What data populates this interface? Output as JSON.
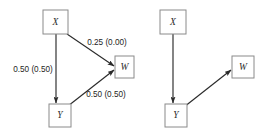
{
  "figure": {
    "type": "path-diagram",
    "background_color": "#ffffff",
    "node_stroke_color": "#8a8a8a",
    "edge_color": "#2a2a2a",
    "panels": [
      {
        "id": "left-panel",
        "nodes": [
          {
            "id": "x",
            "label": "X",
            "x": 43,
            "y": 10,
            "w": 25,
            "h": 24
          },
          {
            "id": "w",
            "label": "W",
            "x": 115,
            "y": 56,
            "w": 19,
            "h": 22
          },
          {
            "id": "y",
            "label": "Y",
            "x": 49,
            "y": 104,
            "w": 22,
            "h": 23
          }
        ],
        "edges": [
          {
            "id": "x-to-w",
            "from": "x",
            "to": "w",
            "label": "0.25 (0.00)",
            "label_x": 107,
            "label_y": 43,
            "x1": 67,
            "y1": 34,
            "x2": 114,
            "y2": 66
          },
          {
            "id": "x-to-y",
            "from": "x",
            "to": "y",
            "label": "0.50 (0.50)",
            "label_x": 33,
            "label_y": 70,
            "x1": 56,
            "y1": 34,
            "x2": 56,
            "y2": 103
          },
          {
            "id": "y-to-w",
            "from": "y",
            "to": "w",
            "label": "0.50 (0.50)",
            "label_x": 106,
            "label_y": 95,
            "x1": 68,
            "y1": 106,
            "x2": 114,
            "y2": 70
          }
        ]
      },
      {
        "id": "right-panel",
        "nodes": [
          {
            "id": "x2",
            "label": "X",
            "x": 160,
            "y": 10,
            "w": 26,
            "h": 24
          },
          {
            "id": "w2",
            "label": "W",
            "x": 232,
            "y": 56,
            "w": 22,
            "h": 22
          },
          {
            "id": "y2",
            "label": "Y",
            "x": 165,
            "y": 104,
            "w": 22,
            "h": 23
          }
        ],
        "edges": [
          {
            "id": "x2-to-y2",
            "from": "x2",
            "to": "y2",
            "label": "",
            "label_x": 0,
            "label_y": 0,
            "x1": 173,
            "y1": 34,
            "x2": 173,
            "y2": 103
          },
          {
            "id": "y2-to-w2",
            "from": "y2",
            "to": "w2",
            "label": "",
            "label_x": 0,
            "label_y": 0,
            "x1": 184,
            "y1": 107,
            "x2": 231,
            "y2": 70
          }
        ]
      }
    ]
  }
}
